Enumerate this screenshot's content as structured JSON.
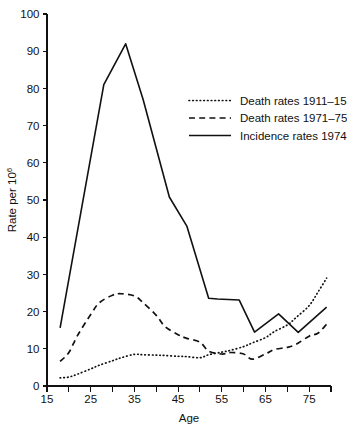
{
  "chart_data": {
    "type": "line",
    "title": "",
    "xlabel": "Age",
    "ylabel": "Rate per 10",
    "ylabel_superscript": "6",
    "xlim": [
      15,
      80
    ],
    "ylim": [
      0,
      100
    ],
    "grid": false,
    "legend_position": "upper right",
    "x_major_ticks": [
      15,
      25,
      35,
      45,
      55,
      65,
      75
    ],
    "x_major_tick_labels": [
      "15",
      "25",
      "35",
      "45",
      "55",
      "65",
      "75"
    ],
    "x_minor_ticks": [
      20,
      30,
      40,
      50,
      60,
      70,
      80
    ],
    "y_ticks": [
      0,
      10,
      20,
      30,
      40,
      50,
      60,
      70,
      80,
      90,
      100
    ],
    "y_tick_labels": [
      "0",
      "10",
      "20",
      "30",
      "40",
      "50",
      "60",
      "70",
      "80",
      "90",
      "100"
    ],
    "series": [
      {
        "name": "Death rates 1911–15",
        "style": "dotted",
        "x": [
          18,
          20,
          22,
          25,
          27,
          30,
          32,
          35,
          37,
          40,
          42,
          45,
          47,
          50,
          52,
          55,
          57,
          60,
          62,
          65,
          67,
          70,
          72,
          75,
          77,
          79
        ],
        "values": [
          2.2,
          2.4,
          3.2,
          4.6,
          5.6,
          6.8,
          7.6,
          8.5,
          8.4,
          8.3,
          8.2,
          8.0,
          7.9,
          7.6,
          8.4,
          9.1,
          9.6,
          10.6,
          11.6,
          13.0,
          14.6,
          16.4,
          18.4,
          21.6,
          25.2,
          29.0
        ]
      },
      {
        "name": "Death rates 1971–75",
        "style": "dashed",
        "x": [
          18,
          20,
          22,
          25,
          27,
          30,
          32,
          35,
          37,
          40,
          42,
          45,
          47,
          50,
          52,
          55,
          57,
          60,
          62,
          65,
          67,
          70,
          72,
          75,
          77,
          79
        ],
        "values": [
          6.6,
          9.0,
          13.6,
          19.2,
          22.4,
          24.4,
          24.8,
          24.2,
          22.4,
          19.0,
          16.0,
          13.8,
          12.8,
          11.8,
          9.4,
          8.6,
          9.0,
          8.6,
          7.2,
          8.6,
          9.8,
          10.4,
          11.2,
          13.4,
          14.2,
          16.6
        ]
      },
      {
        "name": "Incidence rates 1974",
        "style": "solid",
        "x": [
          18,
          28,
          33,
          37,
          43,
          47,
          52,
          54,
          59,
          62.5,
          68,
          72.5,
          79
        ],
        "values": [
          15.6,
          81.0,
          92.0,
          77.0,
          50.8,
          43.0,
          23.6,
          23.4,
          23.1,
          14.5,
          19.4,
          14.4,
          21.2
        ]
      }
    ]
  },
  "legend": {
    "items": [
      {
        "label": "Death rates 1911–15",
        "style": "dotted"
      },
      {
        "label": "Death rates 1971–75",
        "style": "dashed"
      },
      {
        "label": "Incidence rates 1974",
        "style": "solid"
      }
    ]
  },
  "colors": {
    "line": "#111111",
    "background": "#ffffff",
    "axis": "#111111"
  }
}
